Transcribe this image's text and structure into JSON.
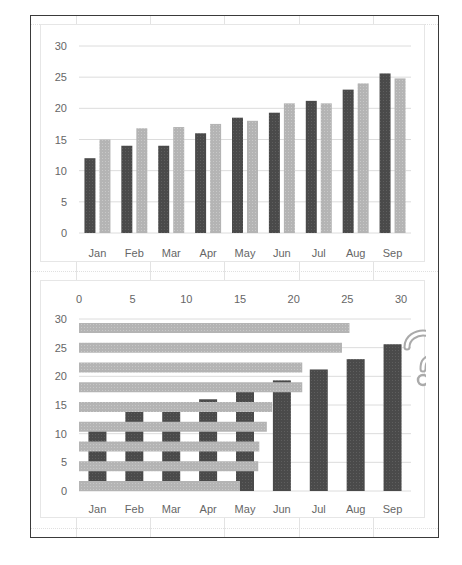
{
  "colors": {
    "series_dark": "#4a4a4a",
    "series_light": "#b4b4b4",
    "gridline": "#dcdcdc",
    "frame": "#3a3a3a",
    "question_mark": "#aaaaaa"
  },
  "chart_data": [
    {
      "type": "bar",
      "title": "",
      "xlabel": "",
      "ylabel": "",
      "categories": [
        "Jan",
        "Feb",
        "Mar",
        "Apr",
        "May",
        "Jun",
        "Jul",
        "Aug",
        "Sep"
      ],
      "series": [
        {
          "name": "Series 1 (dark)",
          "values": [
            12,
            14,
            14,
            16,
            18.5,
            19.3,
            21.2,
            23,
            25.6
          ]
        },
        {
          "name": "Series 2 (light)",
          "values": [
            15,
            16.8,
            17,
            17.5,
            18,
            20.8,
            20.8,
            24,
            24.8
          ]
        }
      ],
      "ylim": [
        0,
        30
      ],
      "yticks": [
        0,
        5,
        10,
        15,
        20,
        25,
        30
      ],
      "grid": true,
      "legend": "none"
    },
    {
      "type": "bar",
      "title": "",
      "xlabel": "",
      "ylabel": "",
      "description": "Combined chart: dark vertical columns by month overlaid with light horizontal bars on a secondary top axis, annotated with a question mark",
      "categories": [
        "Jan",
        "Feb",
        "Mar",
        "Apr",
        "May",
        "Jun",
        "Jul",
        "Aug",
        "Sep"
      ],
      "series": [
        {
          "name": "Series 1 (dark, vertical)",
          "values": [
            12,
            14,
            14,
            16,
            18.5,
            19.3,
            21.2,
            23,
            25.6
          ]
        },
        {
          "name": "Series 2 (light, horizontal, listed top to bottom)",
          "values": [
            25.2,
            24.5,
            20.8,
            20.8,
            18,
            17.5,
            16.8,
            16.7,
            15
          ]
        }
      ],
      "ylim": [
        0,
        30
      ],
      "yticks": [
        0,
        5,
        10,
        15,
        20,
        25,
        30
      ],
      "top_axis_ticks": [
        0,
        5,
        10,
        15,
        20,
        25,
        30
      ],
      "top_axis_range": [
        0,
        30
      ],
      "grid": true,
      "legend": "none",
      "annotation": "?"
    }
  ],
  "top_chart": {
    "yticks": [
      "0",
      "5",
      "10",
      "15",
      "20",
      "25",
      "30"
    ],
    "xticks": [
      "Jan",
      "Feb",
      "Mar",
      "Apr",
      "May",
      "Jun",
      "Jul",
      "Aug",
      "Sep"
    ]
  },
  "bottom_chart": {
    "yticks": [
      "0",
      "5",
      "10",
      "15",
      "20",
      "25",
      "30"
    ],
    "top_ticks": [
      "0",
      "5",
      "10",
      "15",
      "20",
      "25",
      "30"
    ],
    "xticks": [
      "Jan",
      "Feb",
      "Mar",
      "Apr",
      "May",
      "Jun",
      "Jul",
      "Aug",
      "Sep"
    ],
    "annotation_icon": "question-mark-icon"
  }
}
